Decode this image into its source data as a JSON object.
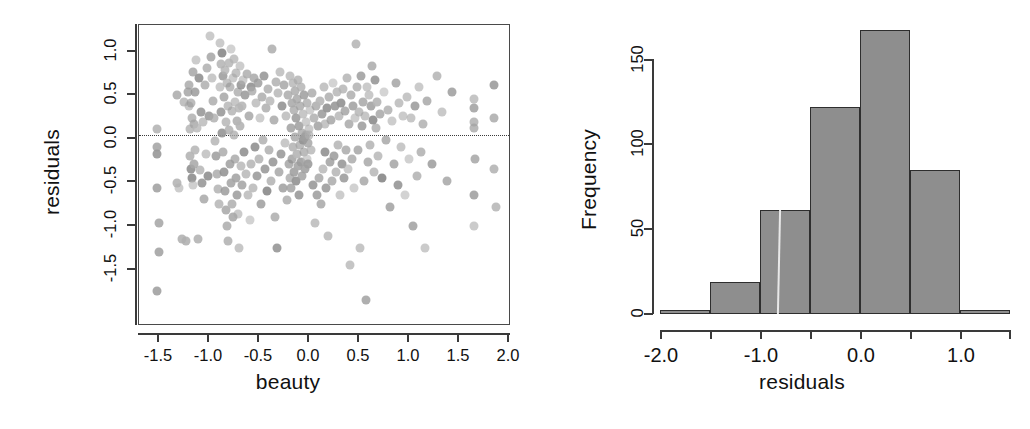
{
  "figure": {
    "panels": [
      "scatter",
      "histogram"
    ],
    "ink_color": "#3a3a3a",
    "point_color": "#9a9a9a",
    "bar_fill": "#8e8e8e",
    "bar_edge": "#2e2e2e"
  },
  "scatter": {
    "xlabel": "beauty",
    "ylabel": "residuals",
    "xticks": [
      "-1.5",
      "-1.0",
      "-0.5",
      "0.0",
      "0.5",
      "1.0",
      "1.5",
      "2.0"
    ],
    "xtick_values": [
      -1.5,
      -1.0,
      -0.5,
      0.0,
      0.5,
      1.0,
      1.5,
      2.0
    ],
    "yticks": [
      "1.0",
      "0.5",
      "0.0",
      "-0.5",
      "-1.0",
      "-1.5"
    ],
    "ytick_values": [
      1.0,
      0.5,
      0.0,
      -0.5,
      -1.0,
      -1.5
    ],
    "reference_line": 0.0
  },
  "histogram": {
    "xlabel": "residuals",
    "ylabel": "Frequency",
    "xticks": [
      "-2.0",
      "-1.0",
      "0.0",
      "1.0"
    ],
    "xtick_values": [
      -2.0,
      -1.0,
      0.0,
      1.0
    ],
    "xminor_values": [
      -1.5,
      -0.5,
      0.5,
      1.5
    ],
    "yticks": [
      "0",
      "50",
      "100",
      "150"
    ],
    "ytick_values": [
      0,
      50,
      100,
      150
    ]
  },
  "chart_data": [
    {
      "type": "scatter",
      "title": "",
      "xlabel": "beauty",
      "ylabel": "residuals",
      "xlim": [
        -1.72,
        2.05
      ],
      "ylim": [
        -1.99,
        1.15
      ],
      "grid": false,
      "legend": "none",
      "annotations": [
        {
          "type": "hline",
          "y": 0.0,
          "style": "dotted",
          "label": ""
        }
      ],
      "marker": {
        "shape": "circle",
        "color": "#9a9a9a",
        "alpha": 0.75,
        "size": 9
      },
      "n_points": 430,
      "x": [
        -1.54,
        -1.54,
        -1.54,
        -1.54,
        -1.54,
        -1.52,
        -1.52,
        -1.33,
        -1.33,
        -1.31,
        -1.28,
        -1.26,
        -1.24,
        -1.22,
        -1.21,
        -1.21,
        -1.2,
        -1.2,
        -1.19,
        -1.19,
        -1.18,
        -1.18,
        -1.17,
        -1.17,
        -1.16,
        -1.16,
        -1.15,
        -1.15,
        -1.14,
        -1.13,
        -1.12,
        -1.11,
        -1.1,
        -1.09,
        -1.08,
        -1.07,
        -1.06,
        -1.05,
        -1.04,
        -1.03,
        -1.02,
        -1.01,
        -1.0,
        -0.99,
        -0.98,
        -0.97,
        -0.96,
        -0.95,
        -0.94,
        -0.93,
        -0.92,
        -0.91,
        -0.9,
        -0.9,
        -0.89,
        -0.89,
        -0.88,
        -0.88,
        -0.87,
        -0.87,
        -0.86,
        -0.86,
        -0.85,
        -0.85,
        -0.84,
        -0.84,
        -0.83,
        -0.83,
        -0.82,
        -0.82,
        -0.81,
        -0.81,
        -0.8,
        -0.8,
        -0.79,
        -0.79,
        -0.78,
        -0.78,
        -0.77,
        -0.77,
        -0.76,
        -0.76,
        -0.75,
        -0.75,
        -0.74,
        -0.74,
        -0.73,
        -0.73,
        -0.72,
        -0.72,
        -0.71,
        -0.71,
        -0.7,
        -0.7,
        -0.69,
        -0.69,
        -0.68,
        -0.68,
        -0.67,
        -0.66,
        -0.65,
        -0.64,
        -0.63,
        -0.62,
        -0.61,
        -0.6,
        -0.59,
        -0.58,
        -0.57,
        -0.56,
        -0.55,
        -0.54,
        -0.53,
        -0.52,
        -0.51,
        -0.5,
        -0.49,
        -0.48,
        -0.47,
        -0.46,
        -0.45,
        -0.44,
        -0.43,
        -0.42,
        -0.41,
        -0.4,
        -0.39,
        -0.38,
        -0.37,
        -0.36,
        -0.35,
        -0.34,
        -0.33,
        -0.32,
        -0.31,
        -0.3,
        -0.29,
        -0.28,
        -0.27,
        -0.26,
        -0.25,
        -0.24,
        -0.23,
        -0.22,
        -0.21,
        -0.2,
        -0.19,
        -0.19,
        -0.18,
        -0.18,
        -0.17,
        -0.17,
        -0.16,
        -0.16,
        -0.15,
        -0.15,
        -0.14,
        -0.14,
        -0.13,
        -0.13,
        -0.12,
        -0.12,
        -0.11,
        -0.11,
        -0.1,
        -0.1,
        -0.09,
        -0.09,
        -0.08,
        -0.08,
        -0.07,
        -0.07,
        -0.06,
        -0.06,
        -0.05,
        -0.05,
        -0.04,
        -0.04,
        -0.03,
        -0.03,
        -0.02,
        -0.02,
        -0.01,
        -0.01,
        0.0,
        0.0,
        0.01,
        0.02,
        0.03,
        0.04,
        0.05,
        0.06,
        0.07,
        0.08,
        0.09,
        0.1,
        0.11,
        0.12,
        0.13,
        0.14,
        0.15,
        0.16,
        0.17,
        0.18,
        0.19,
        0.2,
        0.21,
        0.22,
        0.23,
        0.24,
        0.25,
        0.26,
        0.27,
        0.28,
        0.29,
        0.3,
        0.31,
        0.32,
        0.33,
        0.34,
        0.35,
        0.36,
        0.37,
        0.38,
        0.39,
        0.4,
        0.41,
        0.42,
        0.43,
        0.44,
        0.45,
        0.46,
        0.47,
        0.48,
        0.49,
        0.5,
        0.51,
        0.52,
        0.53,
        0.54,
        0.55,
        0.56,
        0.57,
        0.58,
        0.59,
        0.6,
        0.61,
        0.62,
        0.63,
        0.64,
        0.65,
        0.66,
        0.67,
        0.68,
        0.69,
        0.7,
        0.72,
        0.74,
        0.76,
        0.78,
        0.8,
        0.82,
        0.84,
        0.86,
        0.88,
        0.9,
        0.92,
        0.94,
        0.96,
        0.98,
        1.0,
        1.02,
        1.04,
        1.06,
        1.08,
        1.1,
        1.12,
        1.14,
        1.16,
        1.18,
        1.2,
        1.25,
        1.3,
        1.35,
        1.4,
        1.45,
        1.67,
        1.67,
        1.67,
        1.67,
        1.67,
        1.67,
        1.69,
        1.88,
        1.88,
        1.88,
        1.9
      ],
      "y": [
        0.06,
        -0.12,
        -0.2,
        -0.55,
        -1.62,
        -0.92,
        -1.22,
        -0.5,
        0.42,
        -0.55,
        -1.08,
        0.35,
        -1.1,
        0.45,
        0.3,
        0.52,
        0.06,
        -0.22,
        0.34,
        -0.35,
        0.18,
        -0.45,
        0.66,
        -0.52,
        0.12,
        -0.3,
        0.45,
        -0.15,
        0.78,
        0.08,
        -1.08,
        0.6,
        -0.36,
        0.24,
        -0.5,
        0.14,
        -0.66,
        0.52,
        -0.2,
        0.7,
        -0.42,
        0.2,
        1.04,
        0.82,
        0.6,
        0.36,
        0.18,
        -0.06,
        -0.22,
        -0.4,
        -0.56,
        -0.72,
        0.96,
        0.5,
        0.74,
        0.24,
        0.86,
        0.02,
        0.62,
        -0.18,
        0.4,
        -0.38,
        0.68,
        -0.58,
        0.14,
        -0.78,
        0.55,
        -0.95,
        0.3,
        -1.1,
        0.75,
        0.05,
        0.5,
        -0.3,
        0.9,
        -0.5,
        0.25,
        -0.72,
        0.6,
        -0.85,
        0.8,
        0.0,
        0.35,
        -0.25,
        0.65,
        -0.45,
        0.15,
        -0.62,
        0.45,
        -0.82,
        0.28,
        -1.18,
        0.72,
        0.1,
        0.52,
        -0.32,
        0.3,
        -0.52,
        0.58,
        -0.18,
        0.42,
        -0.4,
        0.64,
        -0.62,
        0.2,
        -0.88,
        0.5,
        -0.3,
        0.46,
        -0.55,
        0.6,
        -0.12,
        0.34,
        -0.42,
        0.55,
        -0.25,
        0.18,
        -0.72,
        0.4,
        -0.05,
        0.62,
        -0.35,
        0.28,
        -0.58,
        0.48,
        -0.15,
        0.36,
        -0.48,
        0.9,
        -0.28,
        0.16,
        -0.85,
        0.56,
        -1.18,
        0.44,
        -0.38,
        0.66,
        -0.2,
        0.3,
        -0.55,
        0.52,
        -0.08,
        0.2,
        -0.68,
        0.42,
        -0.3,
        0.62,
        -0.45,
        0.08,
        -0.55,
        0.34,
        -0.25,
        0.54,
        -0.12,
        0.26,
        -0.38,
        0.46,
        -0.02,
        0.18,
        -0.48,
        0.38,
        -0.2,
        0.58,
        -0.32,
        0.1,
        -0.62,
        0.3,
        -0.1,
        0.5,
        -0.28,
        0.02,
        -0.42,
        0.22,
        -0.05,
        0.42,
        -0.18,
        -0.02,
        -0.35,
        0.14,
        0.0,
        0.34,
        -0.25,
        -0.08,
        -0.3,
        0.06,
        0.0,
        0.26,
        -0.15,
        0.44,
        -0.52,
        0.18,
        -0.92,
        0.3,
        -0.62,
        0.1,
        -0.45,
        0.36,
        -0.72,
        0.22,
        -0.35,
        0.5,
        -0.18,
        0.12,
        -0.55,
        0.28,
        -1.05,
        0.4,
        -0.28,
        0.16,
        -0.48,
        0.55,
        -0.22,
        0.3,
        -0.38,
        0.45,
        -0.1,
        0.2,
        -0.62,
        0.34,
        -0.3,
        0.48,
        -0.45,
        0.25,
        -0.15,
        0.6,
        -0.35,
        0.12,
        -1.35,
        0.42,
        -0.25,
        0.3,
        -0.55,
        0.18,
        0.95,
        0.5,
        -0.15,
        0.24,
        -1.18,
        0.62,
        0.1,
        0.35,
        -0.48,
        0.2,
        -1.72,
        0.5,
        -0.28,
        0.42,
        -0.1,
        0.3,
        0.72,
        0.16,
        -0.38,
        0.58,
        0.08,
        0.35,
        -0.22,
        0.22,
        -0.45,
        0.45,
        -0.05,
        0.26,
        -0.75,
        0.15,
        -0.3,
        0.55,
        -0.52,
        0.34,
        -0.12,
        0.2,
        -0.62,
        0.4,
        -0.25,
        0.18,
        -0.95,
        0.3,
        -0.42,
        0.5,
        -0.18,
        0.12,
        -1.18,
        0.36,
        -0.3,
        0.62,
        0.24,
        -0.48,
        0.45,
        0.14,
        -0.62,
        0.28,
        -0.95,
        0.38,
        0.08,
        -0.25,
        0.52,
        -0.35,
        0.18,
        -0.75,
        0.3,
        -0.45,
        0.2,
        -0.52,
        0.34,
        -1.1,
        0.12,
        -0.3,
        0.42,
        -0.62,
        0.24,
        0.18,
        -0.28,
        0.5,
        -0.48,
        0.78,
        0.68,
        0.5,
        0.38,
        -0.3,
        -0.62,
        0.2,
        0.42,
        0.36,
        -0.65,
        -0.85
      ]
    },
    {
      "type": "bar",
      "subtype": "histogram",
      "title": "",
      "xlabel": "residuals",
      "ylabel": "Frequency",
      "grid": false,
      "legend": "none",
      "xlim": [
        -2.0,
        1.5
      ],
      "ylim": [
        0,
        175
      ],
      "bin_width": 0.5,
      "bin_edges": [
        -2.0,
        -1.5,
        -1.0,
        -0.5,
        0.0,
        0.5,
        1.0,
        1.5
      ],
      "categories": [
        "[-2.0,-1.5)",
        "[-1.5,-1.0)",
        "[-1.0,-0.5)",
        "[-0.5,0.0)",
        "[0.0,0.5)",
        "[0.5,1.0)",
        "[1.0,1.5)"
      ],
      "values": [
        2,
        19,
        61,
        122,
        167,
        85,
        2
      ]
    }
  ]
}
